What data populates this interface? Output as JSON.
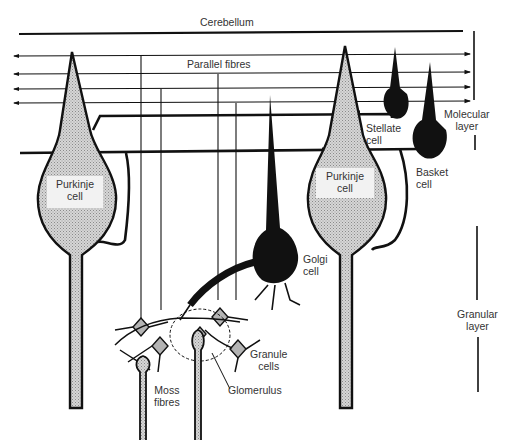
{
  "diagram": {
    "type": "anatomical-schematic",
    "colors": {
      "ink": "#111111",
      "purkinje_fill": "#c8c8c8",
      "granule_fill": "#b4b4b4",
      "background": "#ffffff"
    }
  },
  "labels": {
    "region_title": "Cerebellum",
    "parallel_fibres": "Parallel fibres",
    "purkinje_left_line1": "Purkinje",
    "purkinje_left_line2": "cell",
    "purkinje_right_line1": "Purkinje",
    "purkinje_right_line2": "cell",
    "stellate_line1": "Stellate",
    "stellate_line2": "cell",
    "basket_line1": "Basket",
    "basket_line2": "cell",
    "golgi_line1": "Golgi",
    "golgi_line2": "cell",
    "granule_line1": "Granule",
    "granule_line2": "cells",
    "moss_line1": "Moss",
    "moss_line2": "fibres",
    "glomerulus": "Glomerulus",
    "molecular_line1": "Molecular",
    "molecular_line2": "layer",
    "granular_line1": "Granular",
    "granular_line2": "layer"
  },
  "cells": [
    {
      "name": "Purkinje cell",
      "count": 2,
      "fill": "stippled grey"
    },
    {
      "name": "Stellate cell",
      "count": 1,
      "fill": "black"
    },
    {
      "name": "Basket cell",
      "count": 1,
      "fill": "black"
    },
    {
      "name": "Golgi cell",
      "count": 1,
      "fill": "black"
    },
    {
      "name": "Granule cells",
      "count": 5,
      "fill": "grey"
    },
    {
      "name": "Moss fibres",
      "count": 2
    },
    {
      "name": "Glomerulus",
      "count": 1
    }
  ],
  "layers": [
    "Molecular layer",
    "Granular layer"
  ]
}
